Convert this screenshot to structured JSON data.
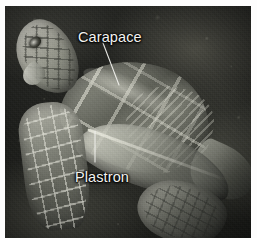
{
  "figure": {
    "kind": "labeled-photograph",
    "rendering": "grayscale",
    "background_color": "#fdfdfd",
    "plate_color": "#1b1d1a",
    "label_color": "#f2f2ef",
    "leader_color": "#f0f0ec"
  },
  "annotations": [
    {
      "id": "carapace",
      "label": "Carapace",
      "target": "upper shell of the turtle",
      "leader": {
        "x1": 103,
        "y1": 43,
        "x2": 119,
        "y2": 85
      }
    },
    {
      "id": "plastron",
      "label": "Plastron",
      "target": "lower shell / belly plate of the turtle",
      "leader": {
        "x1": 95,
        "y1": 162,
        "x2": 95,
        "y2": 131
      }
    }
  ]
}
